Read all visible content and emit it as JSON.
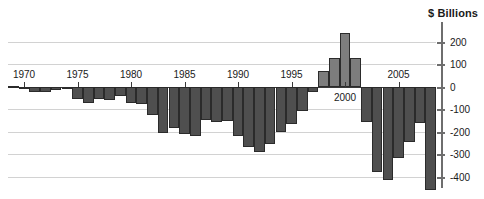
{
  "chart_data": {
    "type": "bar",
    "title": "",
    "subtitle": "",
    "axis_title": "$ Billions",
    "xlabel": "",
    "ylabel": "$ Billions",
    "ylim": [
      -450,
      260
    ],
    "yticks": [
      200,
      100,
      0,
      -100,
      -200,
      -300,
      -400
    ],
    "ytick_labels": [
      "200",
      "100",
      "0",
      "-100",
      "-200",
      "-300",
      "-400"
    ],
    "xticks": [
      1970,
      1975,
      1980,
      1985,
      1990,
      1995,
      2000,
      2005
    ],
    "xtick_labels": [
      "1970",
      "1975",
      "1980",
      "1985",
      "1990",
      "1995",
      "2000",
      "2005"
    ],
    "grid": true,
    "legend": "none",
    "categories": [
      1969,
      1970,
      1971,
      1972,
      1973,
      1974,
      1975,
      1976,
      1977,
      1978,
      1979,
      1980,
      1981,
      1982,
      1983,
      1984,
      1985,
      1986,
      1987,
      1988,
      1989,
      1990,
      1991,
      1992,
      1993,
      1994,
      1995,
      1996,
      1997,
      1998,
      1999,
      2000,
      2001,
      2002,
      2003,
      2004,
      2005,
      2006,
      2007,
      2008
    ],
    "values": [
      3,
      -3,
      -23,
      -23,
      -15,
      -6,
      -53,
      -74,
      -54,
      -59,
      -41,
      -74,
      -79,
      -128,
      -208,
      -185,
      -212,
      -221,
      -150,
      -155,
      -153,
      -221,
      -269,
      -290,
      -255,
      -203,
      -164,
      -107,
      -22,
      69,
      126,
      236,
      128,
      -158,
      -378,
      -413,
      -318,
      -248,
      -161,
      -459
    ],
    "value_unit": "billions of dollars",
    "bar_color_negative": "#4f4f4f",
    "bar_color_positive": "#7d7d7d",
    "bar_edge_color": "#2b2b2b",
    "gridline_color": "#d2d2d2",
    "zeroline_color": "#3a3a3a",
    "axis_color": "#6e6e6e",
    "background_color": "#ffffff"
  }
}
